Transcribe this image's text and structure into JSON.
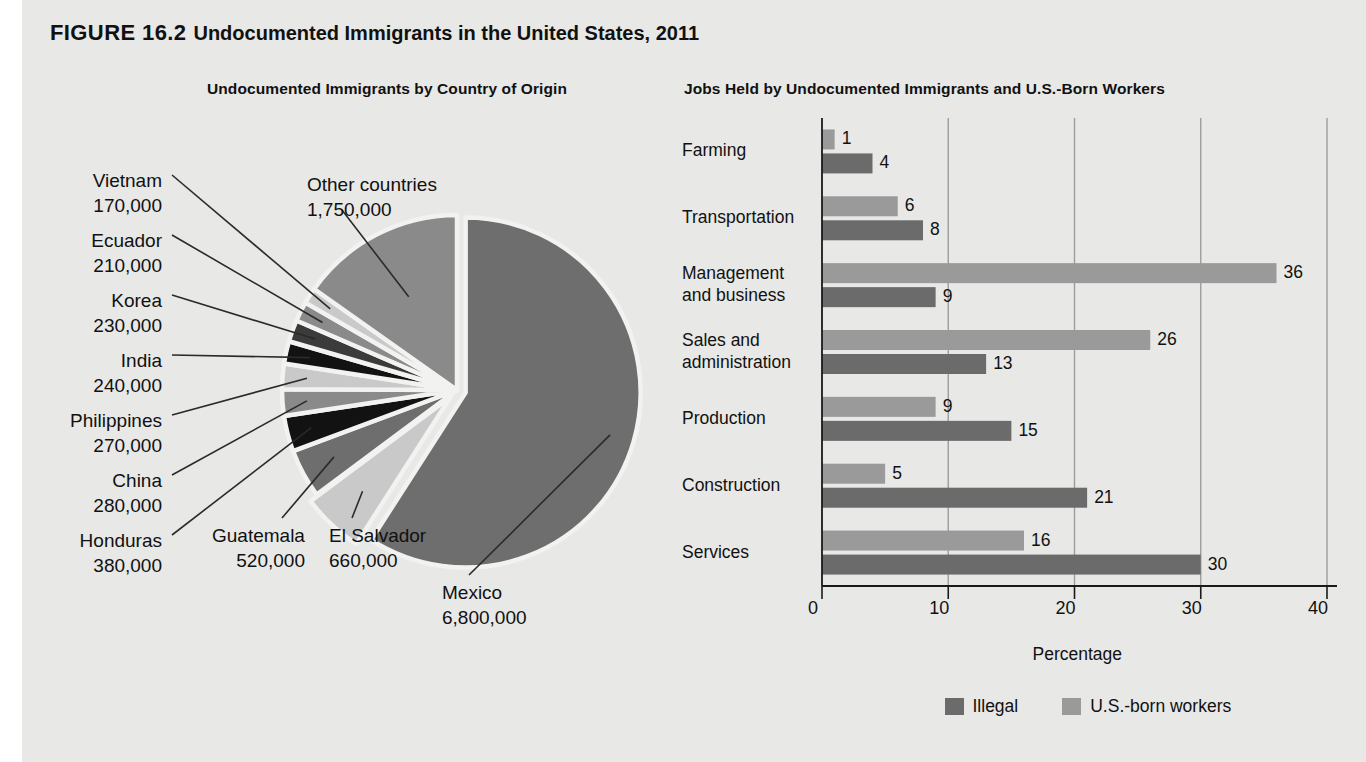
{
  "figure": {
    "label": "FIGURE 16.2",
    "title": "Undocumented Immigrants in the United States, 2011",
    "panel_background": "#e8e8e6"
  },
  "colors": {
    "mexico": "#6e6e6e",
    "other": "#8a8a8a",
    "slice_mid": "#6e6e6e",
    "slice_dark": "#3b3b3b",
    "slice_black": "#121212",
    "slice_light": "#c9c9c9",
    "bar_illegal": "#6b6b6b",
    "bar_usborn": "#9a9a9a",
    "text": "#111111",
    "axis": "#1a1a1a",
    "leader": "#2a2a2a",
    "slice_outline": "#f2f2f0"
  },
  "pie": {
    "subtitle": "Undocumented Immigrants by Country of Origin",
    "total": 11510000,
    "slices": [
      {
        "name": "Mexico",
        "value": 6800000,
        "value_text": "6,800,000",
        "color": "#6e6e6e",
        "exploded": true
      },
      {
        "name": "El Salvador",
        "value": 660000,
        "value_text": "660,000",
        "color": "#c9c9c9",
        "exploded": true
      },
      {
        "name": "Guatemala",
        "value": 520000,
        "value_text": "520,000",
        "color": "#6e6e6e",
        "exploded": false
      },
      {
        "name": "Honduras",
        "value": 380000,
        "value_text": "380,000",
        "color": "#121212",
        "exploded": false
      },
      {
        "name": "China",
        "value": 280000,
        "value_text": "280,000",
        "color": "#8a8a8a",
        "exploded": false
      },
      {
        "name": "Philippines",
        "value": 270000,
        "value_text": "270,000",
        "color": "#c9c9c9",
        "exploded": false
      },
      {
        "name": "India",
        "value": 240000,
        "value_text": "240,000",
        "color": "#121212",
        "exploded": false
      },
      {
        "name": "Korea",
        "value": 230000,
        "value_text": "230,000",
        "color": "#3b3b3b",
        "exploded": false
      },
      {
        "name": "Ecuador",
        "value": 210000,
        "value_text": "210,000",
        "color": "#8a8a8a",
        "exploded": false
      },
      {
        "name": "Vietnam",
        "value": 170000,
        "value_text": "170,000",
        "color": "#c9c9c9",
        "exploded": false
      },
      {
        "name": "Other countries",
        "value": 1750000,
        "value_text": "1,750,000",
        "color": "#8a8a8a",
        "exploded": false
      }
    ]
  },
  "bars": {
    "subtitle": "Jobs Held by Undocumented Immigrants and U.S.-Born Workers",
    "xlabel": "Percentage",
    "xticks": [
      "0",
      "10",
      "20",
      "30",
      "40"
    ],
    "xlim": [
      0,
      40
    ],
    "legend": [
      {
        "label": "Illegal",
        "color": "#6b6b6b"
      },
      {
        "label": "U.S.-born workers",
        "color": "#9a9a9a"
      }
    ],
    "categories": [
      {
        "lines": [
          "Farming"
        ]
      },
      {
        "lines": [
          "Transportation"
        ]
      },
      {
        "lines": [
          "Management",
          "and business"
        ]
      },
      {
        "lines": [
          "Sales and",
          "administration"
        ]
      },
      {
        "lines": [
          "Production"
        ]
      },
      {
        "lines": [
          "Construction"
        ]
      },
      {
        "lines": [
          "Services"
        ]
      }
    ],
    "series": [
      {
        "name": "U.S.-born workers",
        "color": "#9a9a9a",
        "values": [
          1,
          6,
          36,
          26,
          9,
          5,
          16
        ]
      },
      {
        "name": "Illegal",
        "color": "#6b6b6b",
        "values": [
          4,
          8,
          9,
          13,
          15,
          21,
          30
        ]
      }
    ]
  },
  "chart_data": [
    {
      "type": "pie",
      "title": "Undocumented Immigrants by Country of Origin",
      "labels": [
        "Mexico",
        "El Salvador",
        "Guatemala",
        "Honduras",
        "China",
        "Philippines",
        "India",
        "Korea",
        "Ecuador",
        "Vietnam",
        "Other countries"
      ],
      "values": [
        6800000,
        660000,
        520000,
        380000,
        280000,
        270000,
        240000,
        230000,
        210000,
        170000,
        1750000
      ],
      "value_labels": [
        "6,800,000",
        "660,000",
        "520,000",
        "380,000",
        "280,000",
        "270,000",
        "240,000",
        "230,000",
        "210,000",
        "170,000",
        "1,750,000"
      ],
      "legend": "none (leader-line callouts)",
      "grid": false
    },
    {
      "type": "bar",
      "orientation": "horizontal",
      "title": "Jobs Held by Undocumented Immigrants and U.S.-Born Workers",
      "categories": [
        "Farming",
        "Transportation",
        "Management and business",
        "Sales and administration",
        "Production",
        "Construction",
        "Services"
      ],
      "series": [
        {
          "name": "U.S.-born workers",
          "values": [
            1,
            6,
            36,
            26,
            9,
            5,
            16
          ]
        },
        {
          "name": "Illegal",
          "values": [
            4,
            8,
            9,
            13,
            15,
            21,
            30
          ]
        }
      ],
      "xlabel": "Percentage",
      "ylabel": "",
      "xlim": [
        0,
        40
      ],
      "xticks": [
        0,
        10,
        20,
        30,
        40
      ],
      "grid": true,
      "legend_position": "bottom"
    }
  ]
}
